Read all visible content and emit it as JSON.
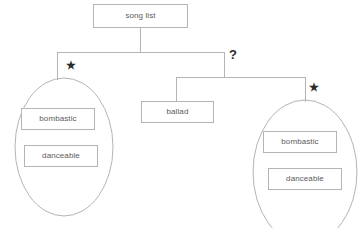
{
  "diagram": {
    "type": "tree",
    "colors": {
      "stroke": "#b4b4b4",
      "text": "#5a5a5a",
      "marker": "#2b2b2b",
      "background": "#ffffff"
    },
    "nodes": [
      {
        "id": "root",
        "label": "song list",
        "shape": "rect",
        "x": 93,
        "y": 4,
        "w": 95,
        "h": 24
      },
      {
        "id": "ballad",
        "label": "ballad",
        "shape": "rect",
        "x": 141,
        "y": 101,
        "w": 73,
        "h": 22
      },
      {
        "id": "left-bombastic",
        "label": "bombastic",
        "shape": "rect",
        "x": 21,
        "y": 108,
        "w": 74,
        "h": 22
      },
      {
        "id": "left-danceable",
        "label": "danceable",
        "shape": "rect",
        "x": 24,
        "y": 145,
        "w": 74,
        "h": 22
      },
      {
        "id": "right-bombastic",
        "label": "bombastic",
        "shape": "rect",
        "x": 263,
        "y": 131,
        "w": 74,
        "h": 22
      },
      {
        "id": "right-danceable",
        "label": "danceable",
        "shape": "rect",
        "x": 268,
        "y": 168,
        "w": 74,
        "h": 22
      }
    ],
    "groups": [
      {
        "id": "left-group",
        "shape": "ellipse",
        "cx": 64,
        "cy": 147,
        "rx": 49,
        "ry": 69,
        "contains": [
          "left-bombastic",
          "left-danceable"
        ]
      },
      {
        "id": "right-group",
        "shape": "ellipse",
        "cx": 305,
        "cy": 172,
        "rx": 52,
        "ry": 72,
        "contains": [
          "right-bombastic",
          "right-danceable"
        ]
      }
    ],
    "markers": [
      {
        "id": "left-star",
        "symbol": "★",
        "kind": "star",
        "x": 66,
        "y": 60,
        "meaning": "repetition"
      },
      {
        "id": "question-mark",
        "symbol": "?",
        "kind": "question",
        "x": 229,
        "y": 48,
        "meaning": "optional"
      },
      {
        "id": "right-star",
        "symbol": "★",
        "kind": "star",
        "x": 309,
        "y": 82,
        "meaning": "repetition"
      }
    ],
    "edges": [
      {
        "id": "root-stem",
        "from": "root",
        "to": "bar-1",
        "path": "M140.5,28 L140.5,52"
      },
      {
        "id": "bar-1",
        "from": "bar-1",
        "to": "bar-1",
        "path": "M57,52 L224,52"
      },
      {
        "id": "bar-1-left-leg",
        "from": "bar-1",
        "to": "left-group",
        "path": "M57,52 L57,80"
      },
      {
        "id": "bar-1-right-leg",
        "from": "bar-1",
        "to": "bar-2",
        "path": "M224,52 L224,77"
      },
      {
        "id": "bar-2",
        "from": "bar-2",
        "to": "bar-2",
        "path": "M176,77 L305,77"
      },
      {
        "id": "bar-2-left-leg",
        "from": "bar-2",
        "to": "ballad",
        "path": "M176,77 L176,101"
      },
      {
        "id": "bar-2-right-leg",
        "from": "bar-2",
        "to": "right-group",
        "path": "M305,77 L305,102"
      }
    ]
  }
}
